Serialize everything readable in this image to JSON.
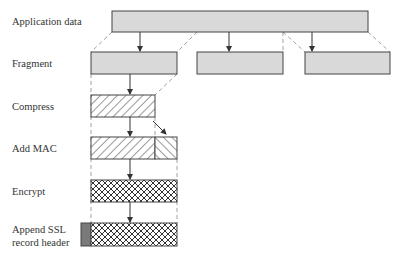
{
  "steps": [
    {
      "id": "application-data",
      "label": "Application data"
    },
    {
      "id": "fragment",
      "label": "Fragment"
    },
    {
      "id": "compress",
      "label": "Compress"
    },
    {
      "id": "add-mac",
      "label": "Add MAC"
    },
    {
      "id": "encrypt",
      "label": "Encrypt"
    },
    {
      "id": "append-header",
      "label_line1": "Append SSL",
      "label_line2": "record header"
    }
  ],
  "colors": {
    "box_fill": "#d9d9d9",
    "stroke": "#444444",
    "header_fill": "#7a7a7a",
    "dashed": "#888888"
  }
}
